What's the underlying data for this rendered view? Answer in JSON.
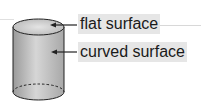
{
  "diagram": {
    "labels": {
      "flat": "flat surface",
      "curved": "curved surface"
    },
    "colors": {
      "body_fill": "#c4c4c4",
      "outline": "#222222",
      "label_bg": "#e6e6e6"
    }
  }
}
